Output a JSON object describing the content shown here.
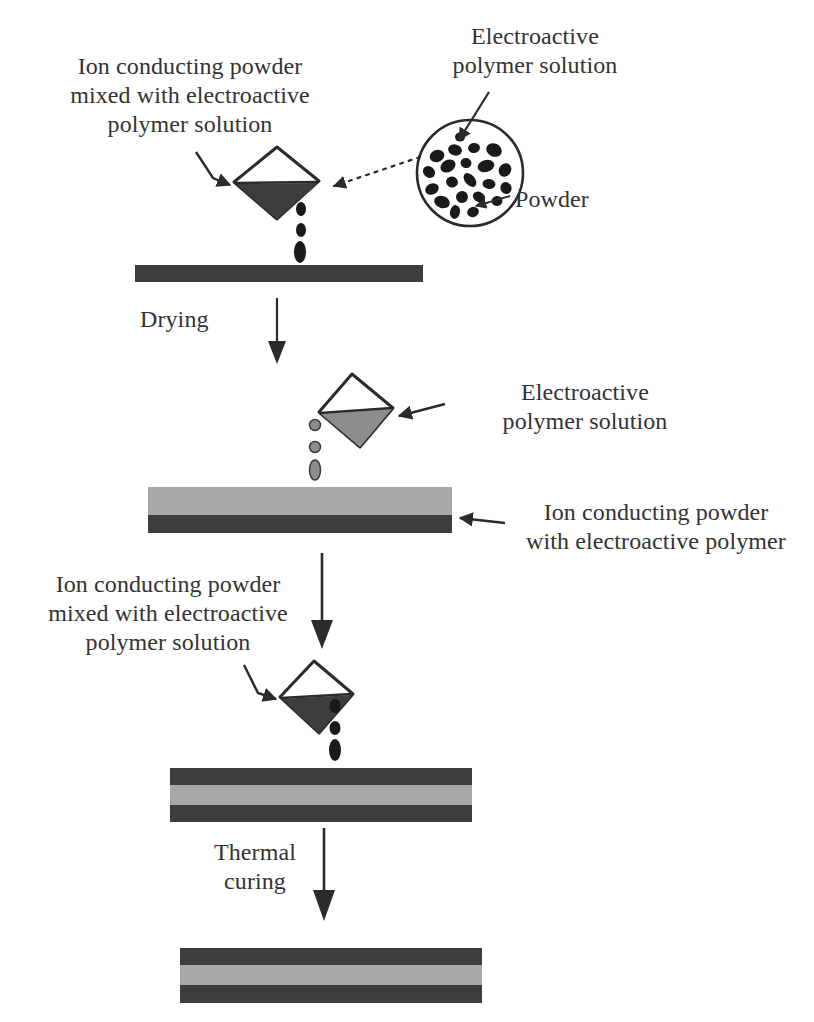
{
  "figure": {
    "background_color": "#ffffff"
  },
  "colors": {
    "dark_layer": "#3d3d3d",
    "light_layer": "#a8a8a8",
    "mid_fill": "#8d8d8d",
    "outline": "#2b2b2b",
    "text": "#333333",
    "particle": "#1a1a1a"
  },
  "labels": {
    "top_left": "Ion conducting powder\nmixed with electroactive\npolymer solution",
    "top_right": "Electroactive\npolymer solution",
    "powder": "Powder",
    "drying": "Drying",
    "stage2_right": "Electroactive\npolymer solution",
    "bilayer_right": "Ion conducting powder\nwith electroactive  polymer",
    "stage3_left": "Ion conducting powder\nmixed with electroactive\npolymer solution",
    "thermal_curing": "Thermal\ncuring"
  },
  "process_steps": [
    {
      "step": 1,
      "name": "cast-powder-polymer-mixture",
      "beaker_fill": "dark",
      "droplets": 3,
      "result": "single-dark-layer"
    },
    {
      "step": 2,
      "name": "drying",
      "arrow_label": "Drying",
      "result": "dried-dark-layer"
    },
    {
      "step": 3,
      "name": "cast-electroactive-polymer-solution",
      "beaker_fill": "mid",
      "droplets": 3,
      "result": "bilayer-light-over-dark"
    },
    {
      "step": 4,
      "name": "cast-powder-polymer-mixture-again",
      "beaker_fill": "dark",
      "droplets": 3,
      "result": "trilayer-dark-light-dark"
    },
    {
      "step": 5,
      "name": "thermal-curing",
      "arrow_label": "Thermal curing",
      "result": "cured-trilayer-film"
    }
  ],
  "bars": [
    {
      "id": "bar-1-single",
      "layers": [
        {
          "color": "#3d3d3d",
          "height": 17
        }
      ]
    },
    {
      "id": "bar-2-bilayer",
      "layers": [
        {
          "color": "#a8a8a8",
          "height": 28
        },
        {
          "color": "#3d3d3d",
          "height": 18
        }
      ]
    },
    {
      "id": "bar-3-trilayer",
      "layers": [
        {
          "color": "#3d3d3d",
          "height": 17
        },
        {
          "color": "#a8a8a8",
          "height": 20
        },
        {
          "color": "#3d3d3d",
          "height": 17
        }
      ]
    },
    {
      "id": "bar-4-cured-trilayer",
      "layers": [
        {
          "color": "#3d3d3d",
          "height": 17
        },
        {
          "color": "#a8a8a8",
          "height": 20
        },
        {
          "color": "#3d3d3d",
          "height": 18
        }
      ]
    }
  ],
  "powder_circle": {
    "particle_count": 21,
    "callout": "Powder"
  }
}
